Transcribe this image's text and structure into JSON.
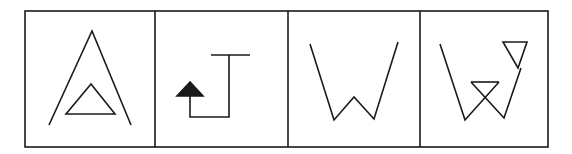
{
  "diagram": {
    "kind": "figure-sequence",
    "stroke_color": "#1a1a1a",
    "background_color": "#ffffff",
    "frame": {
      "x": 25,
      "y": 11,
      "width": 523,
      "height": 136
    },
    "dividers_x": [
      155,
      288,
      420
    ],
    "panels": [
      {
        "index": 1,
        "description": "Large open inverted-V (caret) with a small closed triangle inside near its base",
        "shapes": [
          {
            "type": "polyline",
            "points": "49,125 92,31 131,125"
          },
          {
            "type": "polygon",
            "points": "91,84 66,114 115,114",
            "fill": "none"
          }
        ]
      },
      {
        "index": 2,
        "description": "T-shaped top bar with a vertical stem that turns left at the bottom and rises to a filled arrowhead pointing up",
        "shapes": [
          {
            "type": "polyline",
            "points": "211,55 250,55"
          },
          {
            "type": "polyline",
            "points": "229,55 229,117 190,117 190,96"
          },
          {
            "type": "polygon",
            "points": "190,82 177,96 203,96",
            "fill": "#1a1a1a"
          }
        ]
      },
      {
        "index": 3,
        "description": "Open W shape whose outer arms rise high and whose middle peak is low",
        "shapes": [
          {
            "type": "polyline",
            "points": "310,44 334,120 354,97 374,119 398,42"
          }
        ]
      },
      {
        "index": 4,
        "description": "W shape with an inverted small triangle at its top-right end and crossing lines forming an inverted triangle in the middle",
        "shapes": [
          {
            "type": "polyline",
            "points": "440,44 465,120 499,82"
          },
          {
            "type": "polyline",
            "points": "471,82 504,118 521,68"
          },
          {
            "type": "polyline",
            "points": "471,82 499,82"
          },
          {
            "type": "polygon",
            "points": "503,42 527,42 518,68",
            "fill": "none"
          }
        ]
      }
    ]
  }
}
